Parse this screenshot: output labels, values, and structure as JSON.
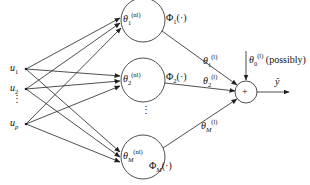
{
  "diagram": {
    "type": "single-hidden-layer neural network",
    "inputs": [
      {
        "symbol": "u",
        "sub": "1"
      },
      {
        "symbol": "u",
        "sub": "2"
      },
      {
        "symbol": "u",
        "sub": "p"
      }
    ],
    "input_ellipsis": "⋮",
    "hidden_nodes": [
      {
        "symbol": "θ",
        "sub": "1",
        "sup": "(nl)",
        "activation": "Φ",
        "act_sub": "1",
        "act_arg": "(·)"
      },
      {
        "symbol": "θ",
        "sub": "2",
        "sup": "(nl)",
        "activation": "Φ",
        "act_sub": "2",
        "act_arg": "(·)"
      },
      {
        "symbol": "θ",
        "sub": "M",
        "sup": "(nl)",
        "activation": "Φ",
        "act_sub": "M",
        "act_arg": "(·)"
      }
    ],
    "hidden_ellipsis": "⋮",
    "output_weights": [
      {
        "symbol": "θ",
        "sub": "1",
        "sup": "(l)"
      },
      {
        "symbol": "θ",
        "sub": "2",
        "sup": "(l)"
      },
      {
        "symbol": "θ",
        "sub": "M",
        "sup": "(l)"
      }
    ],
    "bias": {
      "symbol": "θ",
      "sub": "0",
      "sup": "(l)",
      "note": "(possibly)"
    },
    "sum_node": "+",
    "output": {
      "symbol": "ŷ"
    },
    "colors": {
      "stroke": "#222222",
      "background": "#ffffff"
    }
  }
}
